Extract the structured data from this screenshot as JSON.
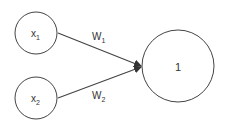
{
  "diagram": {
    "type": "perceptron",
    "colors": {
      "stroke": "#444444",
      "text": "#333333",
      "background": "#ffffff"
    },
    "nodes": [
      {
        "id": "x1",
        "base": "x",
        "sub": "1",
        "cx": 36,
        "cy": 33,
        "r": 21
      },
      {
        "id": "x2",
        "base": "x",
        "sub": "2",
        "cx": 36,
        "cy": 98,
        "r": 21
      },
      {
        "id": "out",
        "label": "1",
        "cx": 178,
        "cy": 66,
        "r": 36
      }
    ],
    "edges": [
      {
        "from": "x1",
        "to": "out",
        "base": "W",
        "sub": "1"
      },
      {
        "from": "x2",
        "to": "out",
        "base": "W",
        "sub": "2"
      }
    ]
  }
}
